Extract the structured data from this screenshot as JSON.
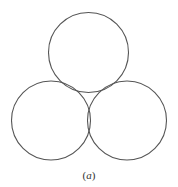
{
  "figure": {
    "stroke_color": "#555555",
    "stroke_width": 1.1,
    "circles": [
      {
        "name": "top-circle",
        "cx": 88.5,
        "cy": 52.5,
        "r": 40
      },
      {
        "name": "bottom-left-circle",
        "cx": 51,
        "cy": 120.5,
        "r": 39.5
      },
      {
        "name": "bottom-right-circle",
        "cx": 127,
        "cy": 120.5,
        "r": 39.5
      }
    ]
  },
  "caption": {
    "open": "(",
    "letter": "a",
    "close": ")"
  }
}
